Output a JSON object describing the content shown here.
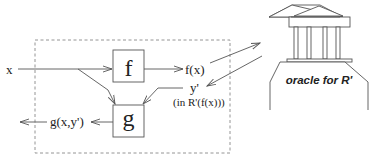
{
  "diagram": {
    "input_label": "x",
    "box_f_label": "f",
    "box_g_label": "g",
    "fx_label": "f(x)",
    "yprime_label": "y'",
    "yprime_note": "(in R'(f(x)))",
    "output_label": "g(x,y')",
    "oracle_label": "oracle for R'"
  },
  "colors": {
    "stroke": "#555555",
    "text": "#222222",
    "background": "#ffffff"
  }
}
